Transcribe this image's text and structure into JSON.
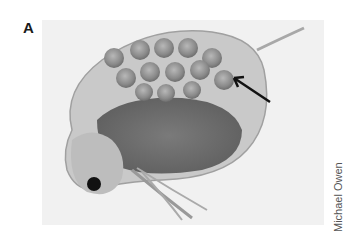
{
  "figure": {
    "panel_label": "A",
    "photo": {
      "subject": "daphnia-with-eggs",
      "description": "Micrograph of a water flea (Daphnia) with a brood chamber full of eggs; arrow points to eggs",
      "background_color": "#f1f1f1"
    },
    "annotation": {
      "type": "arrow",
      "target": "eggs",
      "color": "#111111"
    },
    "credit": "Michael Owen"
  }
}
